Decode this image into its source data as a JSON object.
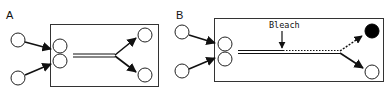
{
  "panels": [
    {
      "label": "A",
      "description": "Two inputs merge into a channel that splits to two outputs",
      "inputs": 2,
      "outputs": [
        {
          "position": "top",
          "state": "open"
        },
        {
          "position": "bottom",
          "state": "open"
        }
      ]
    },
    {
      "label": "B",
      "description": "Two inputs merge; channel bleached partway; top output filled (bleached path dotted)",
      "annotation": "Bleach",
      "inputs": 2,
      "outputs": [
        {
          "position": "top",
          "state": "filled",
          "path": "dotted"
        },
        {
          "position": "bottom",
          "state": "open",
          "path": "solid"
        }
      ]
    }
  ],
  "colors": {
    "stroke": "#1a1a1a",
    "box": "#333333",
    "fill_filled": "#000000",
    "background": "#ffffff"
  }
}
